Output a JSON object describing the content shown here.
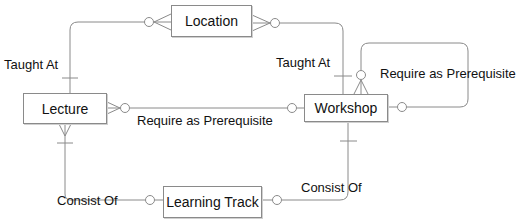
{
  "entities": {
    "location": "Location",
    "lecture": "Lecture",
    "workshop": "Workshop",
    "learning_track": "Learning Track"
  },
  "relationships": {
    "lecture_location": "Taught At",
    "workshop_location": "Taught At",
    "lecture_workshop": "Require as Prerequisite",
    "workshop_self": "Require as Prerequisite",
    "lecture_track": "Consist Of",
    "workshop_track": "Consist Of"
  },
  "colors": {
    "line": "#8a8a8a",
    "text": "#111111",
    "background": "#ffffff"
  }
}
